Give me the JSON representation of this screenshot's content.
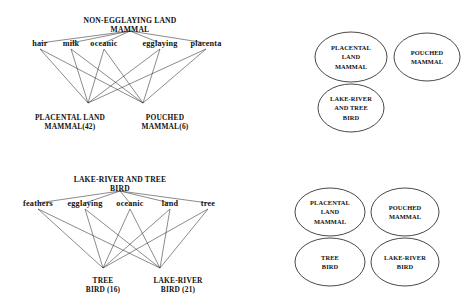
{
  "figure": {
    "background_color": "#ffffff",
    "line_color": "#2a2a2a",
    "text_color": "#111111"
  },
  "lattice_mammal": {
    "top_concept_line1": "NON-EGGLAYING LAND",
    "top_concept_line2": "MAMMAL",
    "attributes": [
      {
        "label": "hair"
      },
      {
        "label": "milk"
      },
      {
        "label": "oceanic"
      },
      {
        "label": "egglaying"
      },
      {
        "label": "placenta"
      }
    ],
    "leaves": [
      {
        "line1": "PLACENTAL LAND",
        "line2": "MAMMAL(42)"
      },
      {
        "line1": "POUCHED",
        "line2": "MAMMAL(6)"
      }
    ]
  },
  "lattice_bird": {
    "top_concept_line1": "LAKE-RIVER AND    TREE",
    "top_concept_line2": "BIRD",
    "attributes": [
      {
        "label": "feathers"
      },
      {
        "label": "egglaying"
      },
      {
        "label": "oceanic"
      },
      {
        "label": "land"
      },
      {
        "label": "tree"
      }
    ],
    "leaves": [
      {
        "line1": "TREE",
        "line2": "BIRD   (16)"
      },
      {
        "line1": "LAKE-RIVER",
        "line2": "BIRD   (21)"
      }
    ]
  },
  "venn_top": {
    "ellipses": [
      {
        "lines": [
          "PLACENTAL",
          "LAND",
          "MAMMAL"
        ]
      },
      {
        "lines": [
          "POUCHED",
          "MAMMAL"
        ]
      },
      {
        "lines": [
          "LAKE-RIVER",
          "AND TREE",
          "BIRD"
        ]
      }
    ]
  },
  "venn_bottom": {
    "ellipses": [
      {
        "lines": [
          "PLACENTAL",
          "LAND",
          "MAMMAL"
        ]
      },
      {
        "lines": [
          "POUCHED",
          "MAMMAL"
        ]
      },
      {
        "lines": [
          "TREE",
          "BIRD"
        ]
      },
      {
        "lines": [
          "LAKE-RIVER",
          "BIRD"
        ]
      }
    ]
  }
}
